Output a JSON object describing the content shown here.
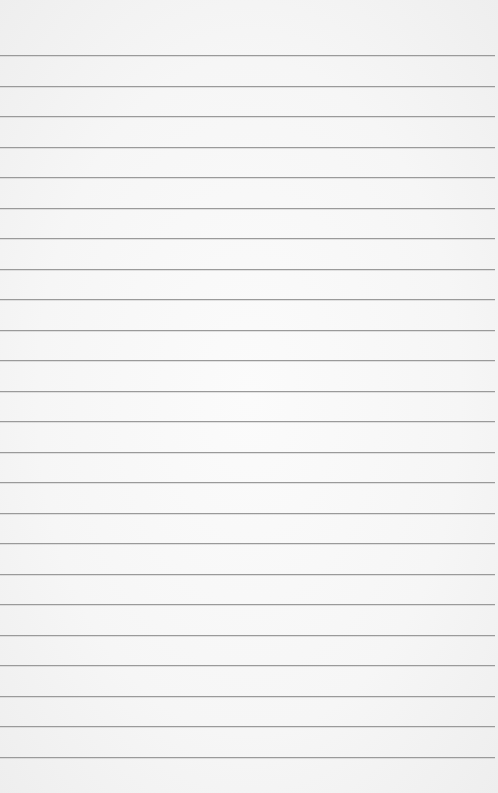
{
  "paper": {
    "background": "#f6f6f6",
    "line_color": "#9a9a9a",
    "first_line_y": 55,
    "line_spacing": 30.5,
    "line_count": 24,
    "line_width": 495
  }
}
